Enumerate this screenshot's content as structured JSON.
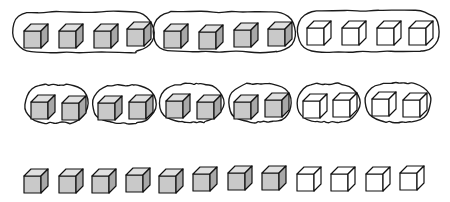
{
  "diagram": {
    "total_cubes": 12,
    "shaded_cubes": 8,
    "unshaded_cubes": 4,
    "canvas": {
      "width": 450,
      "height": 202,
      "background": "#ffffff"
    },
    "colors": {
      "outline": "#1a1a1a",
      "cube_edge": "#111111",
      "cube_front_shaded": "#c9c9c9",
      "cube_top_shaded": "#e0e0e0",
      "cube_side_shaded": "#a8a8a8",
      "cube_front_plain": "#ffffff",
      "cube_top_plain": "#ffffff",
      "cube_side_plain": "#ffffff"
    },
    "cube_geometry": {
      "front_size": 17,
      "depth_x": 7,
      "depth_y": 7
    },
    "rows": [
      {
        "id": "row-groups-of-four",
        "label": "3 groups of 4",
        "group_size": 4,
        "group_count": 3,
        "cube_y": 22,
        "loop_y": 12,
        "loop_height": 40,
        "groups": [
          {
            "id": "row1-group1",
            "loop": {
              "x": 12,
              "y": 12,
              "width": 143,
              "height": 40
            },
            "cubes": [
              {
                "x": 24,
                "y": 24,
                "shaded": true
              },
              {
                "x": 59,
                "y": 24,
                "shaded": true
              },
              {
                "x": 94,
                "y": 24,
                "shaded": true
              },
              {
                "x": 127,
                "y": 22,
                "shaded": true
              }
            ]
          },
          {
            "id": "row1-group2",
            "loop": {
              "x": 153,
              "y": 12,
              "width": 143,
              "height": 40
            },
            "cubes": [
              {
                "x": 164,
                "y": 24,
                "shaded": true
              },
              {
                "x": 199,
                "y": 25,
                "shaded": true
              },
              {
                "x": 234,
                "y": 23,
                "shaded": true
              },
              {
                "x": 268,
                "y": 22,
                "shaded": true
              }
            ]
          },
          {
            "id": "row1-group3",
            "loop": {
              "x": 297,
              "y": 11,
              "width": 143,
              "height": 41
            },
            "cubes": [
              {
                "x": 307,
                "y": 21,
                "shaded": false
              },
              {
                "x": 342,
                "y": 21,
                "shaded": false
              },
              {
                "x": 377,
                "y": 21,
                "shaded": false
              },
              {
                "x": 409,
                "y": 21,
                "shaded": false
              }
            ]
          }
        ]
      },
      {
        "id": "row-groups-of-two",
        "label": "6 groups of 2",
        "group_size": 2,
        "group_count": 6,
        "cube_y": 93,
        "loop_y": 84,
        "loop_height": 38,
        "groups": [
          {
            "id": "row2-group1",
            "loop": {
              "x": 24,
              "y": 85,
              "width": 64,
              "height": 38
            },
            "cubes": [
              {
                "x": 31,
                "y": 95,
                "shaded": true
              },
              {
                "x": 62,
                "y": 96,
                "shaded": true
              }
            ]
          },
          {
            "id": "row2-group2",
            "loop": {
              "x": 92,
              "y": 85,
              "width": 64,
              "height": 38
            },
            "cubes": [
              {
                "x": 98,
                "y": 96,
                "shaded": true
              },
              {
                "x": 129,
                "y": 95,
                "shaded": true
              }
            ]
          },
          {
            "id": "row2-group3",
            "loop": {
              "x": 160,
              "y": 84,
              "width": 64,
              "height": 38
            },
            "cubes": [
              {
                "x": 166,
                "y": 94,
                "shaded": true
              },
              {
                "x": 197,
                "y": 95,
                "shaded": true
              }
            ]
          },
          {
            "id": "row2-group4",
            "loop": {
              "x": 228,
              "y": 84,
              "width": 64,
              "height": 38
            },
            "cubes": [
              {
                "x": 234,
                "y": 95,
                "shaded": true
              },
              {
                "x": 265,
                "y": 93,
                "shaded": true
              }
            ]
          },
          {
            "id": "row2-group5",
            "loop": {
              "x": 296,
              "y": 84,
              "width": 64,
              "height": 38
            },
            "cubes": [
              {
                "x": 303,
                "y": 94,
                "shaded": false
              },
              {
                "x": 333,
                "y": 93,
                "shaded": false
              }
            ]
          },
          {
            "id": "row2-group6",
            "loop": {
              "x": 365,
              "y": 83,
              "width": 66,
              "height": 39
            },
            "cubes": [
              {
                "x": 372,
                "y": 92,
                "shaded": false
              },
              {
                "x": 403,
                "y": 93,
                "shaded": false
              }
            ]
          }
        ]
      },
      {
        "id": "row-single-cubes",
        "label": "12 ones",
        "group_size": 1,
        "group_count": 12,
        "cube_y": 168,
        "groups": [
          {
            "id": "row3-cube1",
            "cubes": [
              {
                "x": 24,
                "y": 169,
                "shaded": true
              }
            ]
          },
          {
            "id": "row3-cube2",
            "cubes": [
              {
                "x": 59,
                "y": 169,
                "shaded": true
              }
            ]
          },
          {
            "id": "row3-cube3",
            "cubes": [
              {
                "x": 92,
                "y": 169,
                "shaded": true
              }
            ]
          },
          {
            "id": "row3-cube4",
            "cubes": [
              {
                "x": 126,
                "y": 168,
                "shaded": true
              }
            ]
          },
          {
            "id": "row3-cube5",
            "cubes": [
              {
                "x": 159,
                "y": 169,
                "shaded": true
              }
            ]
          },
          {
            "id": "row3-cube6",
            "cubes": [
              {
                "x": 193,
                "y": 167,
                "shaded": true
              }
            ]
          },
          {
            "id": "row3-cube7",
            "cubes": [
              {
                "x": 228,
                "y": 166,
                "shaded": true
              }
            ]
          },
          {
            "id": "row3-cube8",
            "cubes": [
              {
                "x": 262,
                "y": 166,
                "shaded": true
              }
            ]
          },
          {
            "id": "row3-cube9",
            "cubes": [
              {
                "x": 297,
                "y": 167,
                "shaded": false
              }
            ]
          },
          {
            "id": "row3-cube10",
            "cubes": [
              {
                "x": 331,
                "y": 167,
                "shaded": false
              }
            ]
          },
          {
            "id": "row3-cube11",
            "cubes": [
              {
                "x": 366,
                "y": 167,
                "shaded": false
              }
            ]
          },
          {
            "id": "row3-cube12",
            "cubes": [
              {
                "x": 400,
                "y": 166,
                "shaded": false
              }
            ]
          }
        ]
      }
    ]
  }
}
